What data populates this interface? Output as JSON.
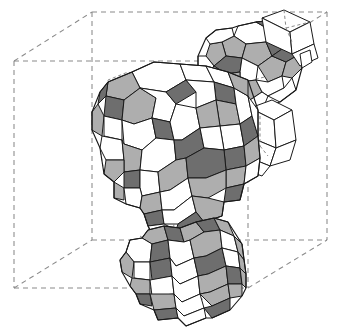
{
  "figure": {
    "title": "Chain of rhombicosidodecahedra inside a dashed wireframe cube",
    "caption": "",
    "background_color": "#ffffff",
    "canvas": {
      "width": 342,
      "height": 329
    }
  },
  "palette": {
    "face_white": "#ffffff",
    "face_light_gray": "#aeaeae",
    "face_dark_gray": "#6e6e6e",
    "visible_edge": "#1a1a1a",
    "hidden_edge": "#767676",
    "cube_edge": "#8a8a8a"
  },
  "bounding_box": {
    "name": "wireframe-cube",
    "line_style": "dashed",
    "stroke": "#8a8a8a",
    "vertices": {
      "front_top_left": [
        14,
        61
      ],
      "front_top_right": [
        248,
        61
      ],
      "front_bottom_left": [
        14,
        288
      ],
      "front_bottom_right": [
        248,
        288
      ],
      "back_top_left": [
        92,
        12
      ],
      "back_top_right": [
        327,
        12
      ],
      "back_bottom_left": [
        92,
        240
      ],
      "back_bottom_right": [
        327,
        240
      ]
    }
  },
  "objects": [
    {
      "name": "main-polyhedron",
      "kind": "rhombicosidodecahedron",
      "center": [
        172,
        155
      ],
      "radius": 88,
      "face_counts": {
        "pentagons": 12,
        "squares": 30,
        "triangles": 20
      },
      "shading": [
        "white",
        "light-gray",
        "dark-gray"
      ]
    },
    {
      "name": "bottom-polyhedron",
      "kind": "rhombicosidodecahedron",
      "center": [
        178,
        268
      ],
      "radius": 58,
      "face_counts": {
        "pentagons": 12,
        "squares": 30,
        "triangles": 20
      },
      "shading": [
        "white",
        "light-gray",
        "dark-gray"
      ]
    },
    {
      "name": "upper-right-polyhedron",
      "kind": "rhombicosidodecahedron",
      "center": [
        253,
        63
      ],
      "radius": 42,
      "face_counts": {
        "pentagons": 12,
        "squares": 30,
        "triangles": 20
      },
      "shading": [
        "white",
        "light-gray",
        "dark-gray"
      ]
    },
    {
      "name": "right-white-prism",
      "kind": "prism",
      "center": [
        268,
        132
      ],
      "radius": 30,
      "shading": [
        "white"
      ]
    },
    {
      "name": "top-right-white-prism",
      "kind": "prism",
      "center": [
        291,
        40
      ],
      "radius": 26,
      "shading": [
        "white"
      ]
    }
  ]
}
